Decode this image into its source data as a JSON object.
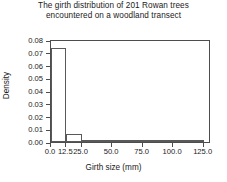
{
  "chart_data": {
    "type": "bar",
    "title": "The girth distribution of 201 Rowan trees encountered on a woodland transect",
    "title_lines": [
      "The girth distribution of 201 Rowan trees",
      "encountered on a woodland transect"
    ],
    "xlabel": "Girth size (mm)",
    "ylabel": "Density",
    "xlim": [
      0.0,
      131.0
    ],
    "ylim": [
      0.0,
      0.081
    ],
    "grid": false,
    "legend": null,
    "bin_edges": [
      0.0,
      12.5,
      25.0,
      50.0,
      125.0
    ],
    "categories": [
      "0.0-12.5",
      "12.5-25.0",
      "25.0-50.0",
      "50.0-125.0"
    ],
    "values": [
      0.074,
      0.006,
      0.001,
      0.0002
    ],
    "bars": [
      {
        "label": "0.0-12.5",
        "x0": 0.0,
        "x1": 12.5,
        "density": 0.074
      },
      {
        "label": "12.5-25.0",
        "x0": 12.5,
        "x1": 25.0,
        "density": 0.006
      },
      {
        "label": "25.0-50.0",
        "x0": 25.0,
        "x1": 50.0,
        "density": 0.001
      },
      {
        "label": "50.0-125.0",
        "x0": 50.0,
        "x1": 125.0,
        "density": 0.0002
      }
    ],
    "xticks": [
      0.0,
      12.5,
      25.0,
      50.0,
      75.0,
      100.0,
      125.0
    ],
    "xtick_labels": [
      "0.0",
      "12.5",
      "25.0",
      "50.0",
      "75.0",
      "100.0",
      "125.0"
    ],
    "yticks": [
      0.0,
      0.01,
      0.02,
      0.03,
      0.04,
      0.05,
      0.06,
      0.07,
      0.08
    ],
    "ytick_labels": [
      "0.00",
      "0.01",
      "0.02",
      "0.03",
      "0.04",
      "0.05",
      "0.06",
      "0.07",
      "0.08"
    ],
    "colors": {
      "bar_fill": "#ffffff",
      "bar_edge": "#595959",
      "axis": "#4d4d4d",
      "text": "#1a1a1a",
      "background": "#ffffff"
    }
  }
}
